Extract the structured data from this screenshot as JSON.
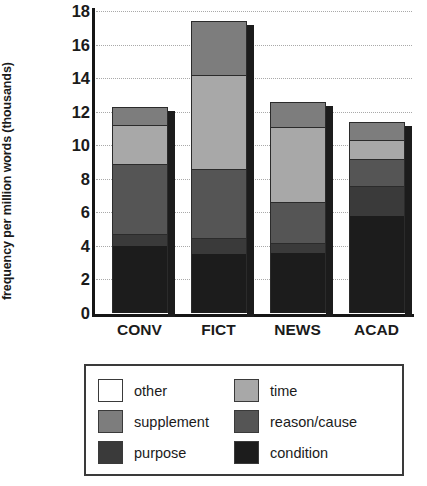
{
  "chart_data": {
    "type": "bar",
    "subtype": "stacked-bar",
    "title": "",
    "xlabel": "",
    "ylabel": "frequency per million words (thousands)",
    "categories": [
      "CONV",
      "FICT",
      "NEWS",
      "ACAD"
    ],
    "ylim": [
      0,
      18
    ],
    "yticks": [
      0,
      2,
      4,
      6,
      8,
      10,
      12,
      14,
      16,
      18
    ],
    "ytick_labels": [
      "0",
      "2",
      "4",
      "6",
      "8",
      "10",
      "12",
      "14",
      "16",
      "18"
    ],
    "grid": true,
    "grid_axis": "y",
    "legend_position": "below-plot",
    "stack_order_bottom_to_top": [
      "condition",
      "purpose",
      "reason/cause",
      "time",
      "supplement",
      "other"
    ],
    "series": [
      {
        "name": "condition",
        "color": "#1c1c1c",
        "values": [
          4.0,
          3.5,
          3.6,
          5.8
        ]
      },
      {
        "name": "purpose",
        "color": "#3a3a3a",
        "values": [
          0.7,
          1.0,
          0.6,
          1.8
        ]
      },
      {
        "name": "reason/cause",
        "color": "#555555",
        "values": [
          4.2,
          4.1,
          2.4,
          1.6
        ]
      },
      {
        "name": "time",
        "color": "#a8a8a8",
        "values": [
          2.3,
          5.6,
          4.5,
          1.1
        ]
      },
      {
        "name": "supplement",
        "color": "#7d7d7d",
        "values": [
          1.1,
          3.2,
          1.5,
          1.1
        ]
      },
      {
        "name": "other",
        "color": "#ffffff",
        "values": [
          1.0,
          3.2,
          1.4,
          1.1
        ]
      }
    ],
    "totals": [
      13.3,
      20.6,
      14.0,
      12.5
    ],
    "bar_tops": [
      12.3,
      17.4,
      12.6,
      11.4
    ],
    "cumulative_boundaries": {
      "CONV": [
        0,
        4.0,
        4.7,
        8.9,
        11.2,
        12.3
      ],
      "FICT": [
        0,
        3.5,
        4.5,
        8.6,
        14.2,
        17.4
      ],
      "NEWS": [
        0,
        3.6,
        4.2,
        6.6,
        11.1,
        12.6
      ],
      "ACAD": [
        0,
        5.8,
        7.6,
        9.2,
        10.3,
        11.4
      ]
    }
  },
  "legend": {
    "items": [
      {
        "label": "other",
        "color": "#ffffff",
        "swatch_name": "swatch-other"
      },
      {
        "label": "time",
        "color": "#a8a8a8",
        "swatch_name": "swatch-time"
      },
      {
        "label": "supplement",
        "color": "#7d7d7d",
        "swatch_name": "swatch-supplement"
      },
      {
        "label": "reason/cause",
        "color": "#555555",
        "swatch_name": "swatch-reason-cause"
      },
      {
        "label": "purpose",
        "color": "#3a3a3a",
        "swatch_name": "swatch-purpose"
      },
      {
        "label": "condition",
        "color": "#1c1c1c",
        "swatch_name": "swatch-condition"
      }
    ]
  }
}
